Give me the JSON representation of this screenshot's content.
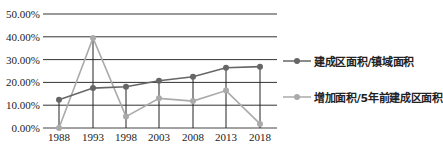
{
  "chart_data": {
    "type": "line",
    "title": "",
    "xlabel": "",
    "ylabel": "",
    "categories": [
      "1988",
      "1993",
      "1998",
      "2003",
      "2008",
      "2013",
      "2018"
    ],
    "series": [
      {
        "name": "建成区面积/镇域面积",
        "color": "#666666",
        "values": [
          12.4,
          17.5,
          18.1,
          20.7,
          22.5,
          26.4,
          26.9
        ]
      },
      {
        "name": "增加面积/5年前建成区面积",
        "color": "#aaaaaa",
        "values": [
          0.0,
          39.5,
          5.0,
          13.0,
          11.8,
          16.4,
          1.8
        ]
      }
    ],
    "ylim": [
      0,
      50
    ],
    "yticks": [
      "0.00%",
      "10.00%",
      "20.00%",
      "30.00%",
      "40.00%",
      "50.00%"
    ],
    "grid": true,
    "legend_position": "right"
  }
}
